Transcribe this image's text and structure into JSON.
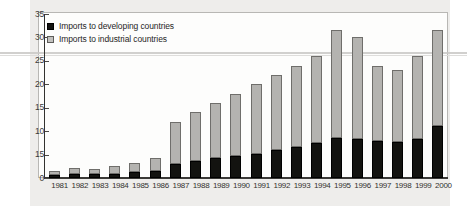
{
  "chart_data": {
    "type": "bar",
    "title": "",
    "subtitle": "",
    "xlabel": "",
    "ylabel": "",
    "stacked": true,
    "grid": false,
    "legend_position": "top-left",
    "ylim": [
      0,
      35
    ],
    "yticks": [
      0,
      5,
      10,
      15,
      20,
      25,
      30,
      35
    ],
    "ytick_labels": [
      "0",
      "15",
      "10",
      "15",
      "20",
      "25",
      "30",
      "35"
    ],
    "categories": [
      "1981",
      "1982",
      "1983",
      "1984",
      "1985",
      "1986",
      "1987",
      "1988",
      "1989",
      "1990",
      "1991",
      "1992",
      "1993",
      "1994",
      "1995",
      "1996",
      "1997",
      "1998",
      "1999",
      "2000"
    ],
    "series": [
      {
        "name": "Imports to developing countries",
        "color": "#121210",
        "values": [
          0.6,
          0.8,
          0.8,
          0.9,
          1.2,
          1.6,
          3.0,
          3.6,
          4.2,
          4.6,
          5.2,
          6.0,
          6.6,
          7.4,
          8.6,
          8.4,
          7.8,
          7.6,
          8.4,
          11.0
        ]
      },
      {
        "name": "Imports to industrial countries",
        "color": "#b4b3b0",
        "values": [
          0.9,
          1.3,
          1.2,
          1.6,
          2.1,
          2.6,
          9.0,
          10.4,
          11.8,
          13.4,
          14.8,
          16.0,
          17.4,
          18.6,
          22.9,
          21.6,
          16.2,
          15.4,
          17.6,
          20.5
        ]
      }
    ],
    "totals": [
      1.5,
      2.1,
      2.0,
      2.5,
      3.3,
      4.2,
      12.0,
      14.0,
      16.0,
      18.0,
      20.0,
      22.0,
      24.0,
      26.0,
      31.5,
      30.0,
      24.0,
      23.0,
      26.0,
      31.5
    ]
  }
}
